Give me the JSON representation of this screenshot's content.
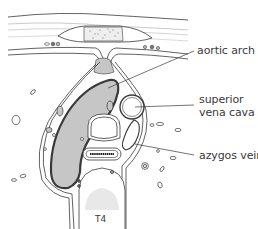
{
  "figure": {
    "caption": "T4",
    "labels": [
      {
        "id": "aortic-arch",
        "text": "aortic arch"
      },
      {
        "id": "superior-vena-cava",
        "line1": "superior",
        "line2": "vena cava"
      },
      {
        "id": "azygos-vein",
        "text": "azygos vein"
      }
    ]
  },
  "colors": {
    "outline": "#3a3a3a",
    "fill_gray": "#c6c6c6",
    "light_band": "#e2e2e2",
    "background": "#ffffff"
  }
}
